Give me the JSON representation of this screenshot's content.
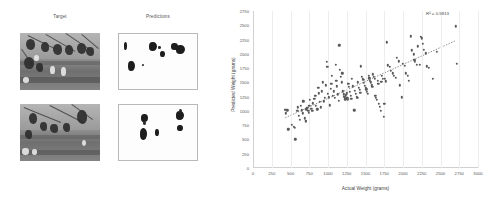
{
  "figure": {
    "qualitative": {
      "columns": [
        {
          "id": "target",
          "label": "Target"
        },
        {
          "id": "predictions",
          "label": "Predictions"
        }
      ],
      "rows": [
        {
          "id": "row-1",
          "target_alt": "grayscale orchard photo row 1",
          "prediction_alt": "binary segmentation mask row 1"
        },
        {
          "id": "row-2",
          "target_alt": "grayscale orchard photo row 2",
          "prediction_alt": "binary segmentation mask row 2"
        }
      ]
    }
  },
  "chart_data": {
    "type": "scatter",
    "title": "",
    "xlabel": "Actual Weight (grams)",
    "ylabel": "Predicted Weight (grams)",
    "xlim": [
      0,
      3000
    ],
    "ylim": [
      0,
      2750
    ],
    "xticks": [
      0,
      250,
      500,
      750,
      1000,
      1250,
      1500,
      1750,
      2000,
      2250,
      2500,
      2750,
      3000
    ],
    "yticks": [
      0,
      250,
      500,
      750,
      1000,
      1250,
      1500,
      1750,
      2000,
      2250,
      2500,
      2750
    ],
    "grid": "vertical",
    "legend": "none",
    "annotations": [
      {
        "id": "r-squared",
        "text": "R² = 0.5813",
        "x": 2600,
        "y": 2700
      }
    ],
    "marker": {
      "color": "#5a5a5a",
      "size": 2.4,
      "shape": "circle"
    },
    "trendline": {
      "type": "linear-dotted",
      "color": "#5a5a5a",
      "x": [
        430,
        2700
      ],
      "y": [
        880,
        2230
      ]
    },
    "points": [
      [
        430,
        1020
      ],
      [
        440,
        960
      ],
      [
        455,
        1010
      ],
      [
        470,
        680
      ],
      [
        520,
        760
      ],
      [
        545,
        720
      ],
      [
        560,
        700
      ],
      [
        565,
        500
      ],
      [
        590,
        1000
      ],
      [
        600,
        1060
      ],
      [
        610,
        910
      ],
      [
        620,
        840
      ],
      [
        640,
        1090
      ],
      [
        650,
        1010
      ],
      [
        665,
        960
      ],
      [
        670,
        1170
      ],
      [
        690,
        870
      ],
      [
        700,
        830
      ],
      [
        705,
        820
      ],
      [
        710,
        1030
      ],
      [
        725,
        1050
      ],
      [
        735,
        1000
      ],
      [
        745,
        970
      ],
      [
        750,
        1090
      ],
      [
        760,
        1190
      ],
      [
        775,
        1040
      ],
      [
        790,
        1000
      ],
      [
        800,
        1130
      ],
      [
        815,
        1210
      ],
      [
        830,
        1260
      ],
      [
        840,
        1090
      ],
      [
        855,
        1030
      ],
      [
        870,
        1410
      ],
      [
        880,
        1310
      ],
      [
        890,
        1160
      ],
      [
        900,
        1060
      ],
      [
        915,
        1340
      ],
      [
        930,
        1500
      ],
      [
        940,
        1170
      ],
      [
        955,
        1230
      ],
      [
        970,
        1450
      ],
      [
        980,
        1860
      ],
      [
        990,
        1770
      ],
      [
        1000,
        1300
      ],
      [
        1010,
        1240
      ],
      [
        1020,
        1100
      ],
      [
        1035,
        1390
      ],
      [
        1045,
        1480
      ],
      [
        1050,
        1620
      ],
      [
        1060,
        1260
      ],
      [
        1075,
        1340
      ],
      [
        1090,
        1230
      ],
      [
        1100,
        1810
      ],
      [
        1110,
        1530
      ],
      [
        1120,
        1430
      ],
      [
        1130,
        1290
      ],
      [
        1140,
        1180
      ],
      [
        1150,
        2150
      ],
      [
        1160,
        1720
      ],
      [
        1170,
        1600
      ],
      [
        1180,
        1500
      ],
      [
        1190,
        1660
      ],
      [
        1200,
        1340
      ],
      [
        1210,
        1290
      ],
      [
        1215,
        1250
      ],
      [
        1225,
        1230
      ],
      [
        1230,
        1200
      ],
      [
        1240,
        1270
      ],
      [
        1250,
        1310
      ],
      [
        1255,
        1220
      ],
      [
        1260,
        1190
      ],
      [
        1270,
        1480
      ],
      [
        1280,
        1420
      ],
      [
        1290,
        1330
      ],
      [
        1300,
        1260
      ],
      [
        1310,
        1210
      ],
      [
        1320,
        1560
      ],
      [
        1330,
        1430
      ],
      [
        1340,
        1020
      ],
      [
        1350,
        1010
      ],
      [
        1360,
        1350
      ],
      [
        1370,
        1300
      ],
      [
        1380,
        1250
      ],
      [
        1390,
        1230
      ],
      [
        1400,
        1500
      ],
      [
        1410,
        1410
      ],
      [
        1420,
        1370
      ],
      [
        1430,
        1320
      ],
      [
        1440,
        1780
      ],
      [
        1450,
        1600
      ],
      [
        1460,
        1560
      ],
      [
        1470,
        1540
      ],
      [
        1480,
        1490
      ],
      [
        1490,
        1440
      ],
      [
        1500,
        1400
      ],
      [
        1510,
        1380
      ],
      [
        1520,
        1330
      ],
      [
        1530,
        1300
      ],
      [
        1540,
        1610
      ],
      [
        1550,
        1570
      ],
      [
        1560,
        1530
      ],
      [
        1570,
        1500
      ],
      [
        1580,
        1450
      ],
      [
        1590,
        1420
      ],
      [
        1600,
        1640
      ],
      [
        1610,
        1600
      ],
      [
        1620,
        1560
      ],
      [
        1630,
        1260
      ],
      [
        1640,
        1230
      ],
      [
        1650,
        1190
      ],
      [
        1660,
        1530
      ],
      [
        1670,
        1480
      ],
      [
        1680,
        1120
      ],
      [
        1690,
        1070
      ],
      [
        1700,
        1000
      ],
      [
        1710,
        1510
      ],
      [
        1720,
        1610
      ],
      [
        1730,
        1560
      ],
      [
        1740,
        900
      ],
      [
        1750,
        1120
      ],
      [
        1760,
        1560
      ],
      [
        1770,
        1520
      ],
      [
        1780,
        2200
      ],
      [
        1800,
        1800
      ],
      [
        1820,
        1770
      ],
      [
        1840,
        1700
      ],
      [
        1860,
        1660
      ],
      [
        1880,
        1620
      ],
      [
        1900,
        1580
      ],
      [
        1920,
        1930
      ],
      [
        1940,
        1870
      ],
      [
        1960,
        1450
      ],
      [
        1980,
        1240
      ],
      [
        2000,
        1820
      ],
      [
        2020,
        1790
      ],
      [
        2040,
        1660
      ],
      [
        2060,
        1610
      ],
      [
        2080,
        1530
      ],
      [
        2100,
        2310
      ],
      [
        2120,
        2060
      ],
      [
        2140,
        1990
      ],
      [
        2150,
        1900
      ],
      [
        2160,
        1870
      ],
      [
        2180,
        1810
      ],
      [
        2200,
        2130
      ],
      [
        2220,
        1810
      ],
      [
        2240,
        2300
      ],
      [
        2250,
        2270
      ],
      [
        2260,
        2180
      ],
      [
        2280,
        2070
      ],
      [
        2300,
        2010
      ],
      [
        2320,
        1780
      ],
      [
        2340,
        1760
      ],
      [
        2400,
        1560
      ],
      [
        2450,
        2040
      ],
      [
        2700,
        2480
      ],
      [
        2720,
        1820
      ]
    ]
  }
}
